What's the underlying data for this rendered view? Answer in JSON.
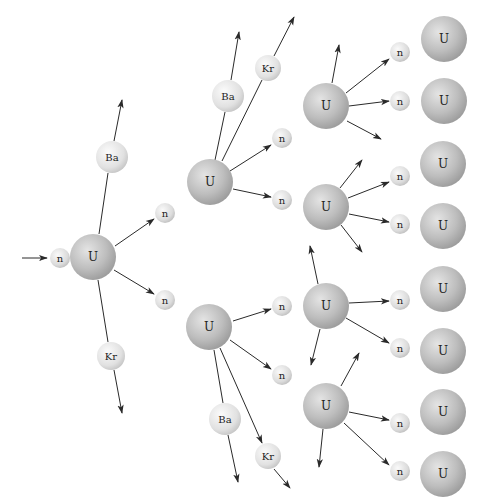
{
  "diagram": {
    "width": 484,
    "height": 500,
    "colors": {
      "uranium_light": "#d9d9d9",
      "uranium_dark": "#9a9a9a",
      "neutron_light": "#f2f2f2",
      "neutron_dark": "#bdbdbd",
      "fragment_light": "#f4f4f4",
      "fragment_dark": "#c4c4c4",
      "arrow": "#2a2a2a",
      "label": "#222222"
    },
    "nuclei": [
      {
        "id": "n0",
        "type": "neutron",
        "label": "n",
        "x": 60,
        "y": 258,
        "r": 10
      },
      {
        "id": "u1",
        "type": "uranium",
        "label": "U",
        "x": 93,
        "y": 257,
        "r": 23
      },
      {
        "id": "ba1",
        "type": "fragment",
        "label": "Ba",
        "x": 112,
        "y": 157,
        "r": 16
      },
      {
        "id": "kr1",
        "type": "fragment",
        "label": "Kr",
        "x": 111,
        "y": 356,
        "r": 14
      },
      {
        "id": "n1a",
        "type": "neutron",
        "label": "n",
        "x": 165,
        "y": 213,
        "r": 10
      },
      {
        "id": "n1b",
        "type": "neutron",
        "label": "n",
        "x": 165,
        "y": 300,
        "r": 10
      },
      {
        "id": "u2a",
        "type": "uranium",
        "label": "U",
        "x": 210,
        "y": 182,
        "r": 23
      },
      {
        "id": "ba2a",
        "type": "fragment",
        "label": "Ba",
        "x": 228,
        "y": 96,
        "r": 16
      },
      {
        "id": "kr2a",
        "type": "fragment",
        "label": "Kr",
        "x": 268,
        "y": 68,
        "r": 13
      },
      {
        "id": "n2a1",
        "type": "neutron",
        "label": "n",
        "x": 282,
        "y": 138,
        "r": 10
      },
      {
        "id": "n2a2",
        "type": "neutron",
        "label": "n",
        "x": 282,
        "y": 200,
        "r": 10
      },
      {
        "id": "u2b",
        "type": "uranium",
        "label": "U",
        "x": 209,
        "y": 327,
        "r": 23
      },
      {
        "id": "ba2b",
        "type": "fragment",
        "label": "Ba",
        "x": 225,
        "y": 419,
        "r": 16
      },
      {
        "id": "kr2b",
        "type": "fragment",
        "label": "Kr",
        "x": 268,
        "y": 456,
        "r": 13
      },
      {
        "id": "n2b1",
        "type": "neutron",
        "label": "n",
        "x": 282,
        "y": 306,
        "r": 10
      },
      {
        "id": "n2b2",
        "type": "neutron",
        "label": "n",
        "x": 282,
        "y": 375,
        "r": 10
      },
      {
        "id": "u3a",
        "type": "uranium",
        "label": "U",
        "x": 326,
        "y": 106,
        "r": 23
      },
      {
        "id": "u3b",
        "type": "uranium",
        "label": "U",
        "x": 326,
        "y": 207,
        "r": 23
      },
      {
        "id": "u3c",
        "type": "uranium",
        "label": "U",
        "x": 326,
        "y": 306,
        "r": 23
      },
      {
        "id": "u3d",
        "type": "uranium",
        "label": "U",
        "x": 326,
        "y": 406,
        "r": 23
      },
      {
        "id": "n3a1",
        "type": "neutron",
        "label": "n",
        "x": 400,
        "y": 52,
        "r": 10
      },
      {
        "id": "n3a2",
        "type": "neutron",
        "label": "n",
        "x": 400,
        "y": 101,
        "r": 10
      },
      {
        "id": "n3b1",
        "type": "neutron",
        "label": "n",
        "x": 400,
        "y": 176,
        "r": 10
      },
      {
        "id": "n3b2",
        "type": "neutron",
        "label": "n",
        "x": 400,
        "y": 224,
        "r": 10
      },
      {
        "id": "n3c1",
        "type": "neutron",
        "label": "n",
        "x": 400,
        "y": 300,
        "r": 10
      },
      {
        "id": "n3c2",
        "type": "neutron",
        "label": "n",
        "x": 400,
        "y": 348,
        "r": 10
      },
      {
        "id": "n3d1",
        "type": "neutron",
        "label": "n",
        "x": 400,
        "y": 423,
        "r": 10
      },
      {
        "id": "n3d2",
        "type": "neutron",
        "label": "n",
        "x": 400,
        "y": 471,
        "r": 10
      },
      {
        "id": "u4a",
        "type": "uranium",
        "label": "U",
        "x": 444,
        "y": 39,
        "r": 23
      },
      {
        "id": "u4b",
        "type": "uranium",
        "label": "U",
        "x": 444,
        "y": 101,
        "r": 23
      },
      {
        "id": "u4c",
        "type": "uranium",
        "label": "U",
        "x": 443,
        "y": 164,
        "r": 23
      },
      {
        "id": "u4d",
        "type": "uranium",
        "label": "U",
        "x": 443,
        "y": 226,
        "r": 23
      },
      {
        "id": "u4e",
        "type": "uranium",
        "label": "U",
        "x": 443,
        "y": 289,
        "r": 23
      },
      {
        "id": "u4f",
        "type": "uranium",
        "label": "U",
        "x": 443,
        "y": 351,
        "r": 23
      },
      {
        "id": "u4g",
        "type": "uranium",
        "label": "U",
        "x": 443,
        "y": 412,
        "r": 23
      },
      {
        "id": "u4h",
        "type": "uranium",
        "label": "U",
        "x": 443,
        "y": 474,
        "r": 23
      }
    ],
    "arrows": [
      {
        "x1": 22,
        "y1": 258,
        "x2": 47,
        "y2": 258,
        "head": true
      },
      {
        "x1": 99,
        "y1": 234,
        "x2": 108,
        "y2": 173,
        "head": false
      },
      {
        "x1": 114,
        "y1": 141,
        "x2": 122,
        "y2": 100,
        "head": true
      },
      {
        "x1": 115,
        "y1": 246,
        "x2": 154,
        "y2": 219,
        "head": true
      },
      {
        "x1": 114,
        "y1": 270,
        "x2": 154,
        "y2": 294,
        "head": true
      },
      {
        "x1": 98,
        "y1": 280,
        "x2": 108,
        "y2": 342,
        "head": false
      },
      {
        "x1": 114,
        "y1": 370,
        "x2": 122,
        "y2": 413,
        "head": true
      },
      {
        "x1": 215,
        "y1": 160,
        "x2": 225,
        "y2": 112,
        "head": false
      },
      {
        "x1": 231,
        "y1": 80,
        "x2": 239,
        "y2": 32,
        "head": true
      },
      {
        "x1": 222,
        "y1": 161,
        "x2": 262,
        "y2": 80,
        "head": false
      },
      {
        "x1": 274,
        "y1": 56,
        "x2": 294,
        "y2": 17,
        "head": true
      },
      {
        "x1": 230,
        "y1": 171,
        "x2": 271,
        "y2": 145,
        "head": true
      },
      {
        "x1": 233,
        "y1": 189,
        "x2": 271,
        "y2": 197,
        "head": true
      },
      {
        "x1": 233,
        "y1": 321,
        "x2": 271,
        "y2": 309,
        "head": true
      },
      {
        "x1": 230,
        "y1": 340,
        "x2": 271,
        "y2": 369,
        "head": true
      },
      {
        "x1": 214,
        "y1": 350,
        "x2": 223,
        "y2": 403,
        "head": false
      },
      {
        "x1": 228,
        "y1": 435,
        "x2": 238,
        "y2": 482,
        "head": true
      },
      {
        "x1": 220,
        "y1": 348,
        "x2": 262,
        "y2": 443,
        "head": true
      },
      {
        "x1": 274,
        "y1": 469,
        "x2": 290,
        "y2": 488,
        "head": true
      },
      {
        "x1": 332,
        "y1": 83,
        "x2": 339,
        "y2": 45,
        "head": true
      },
      {
        "x1": 346,
        "y1": 93,
        "x2": 389,
        "y2": 59,
        "head": true
      },
      {
        "x1": 349,
        "y1": 106,
        "x2": 389,
        "y2": 101,
        "head": true
      },
      {
        "x1": 347,
        "y1": 121,
        "x2": 381,
        "y2": 139,
        "head": true
      },
      {
        "x1": 340,
        "y1": 188,
        "x2": 362,
        "y2": 160,
        "head": true
      },
      {
        "x1": 348,
        "y1": 198,
        "x2": 389,
        "y2": 182,
        "head": true
      },
      {
        "x1": 349,
        "y1": 214,
        "x2": 389,
        "y2": 222,
        "head": true
      },
      {
        "x1": 341,
        "y1": 225,
        "x2": 362,
        "y2": 252,
        "head": true
      },
      {
        "x1": 318,
        "y1": 284,
        "x2": 310,
        "y2": 246,
        "head": true
      },
      {
        "x1": 349,
        "y1": 303,
        "x2": 389,
        "y2": 301,
        "head": true
      },
      {
        "x1": 346,
        "y1": 318,
        "x2": 389,
        "y2": 343,
        "head": true
      },
      {
        "x1": 320,
        "y1": 329,
        "x2": 311,
        "y2": 365,
        "head": true
      },
      {
        "x1": 341,
        "y1": 386,
        "x2": 359,
        "y2": 353,
        "head": true
      },
      {
        "x1": 349,
        "y1": 412,
        "x2": 389,
        "y2": 420,
        "head": true
      },
      {
        "x1": 344,
        "y1": 423,
        "x2": 389,
        "y2": 465,
        "head": true
      },
      {
        "x1": 323,
        "y1": 429,
        "x2": 319,
        "y2": 467,
        "head": true
      }
    ]
  }
}
